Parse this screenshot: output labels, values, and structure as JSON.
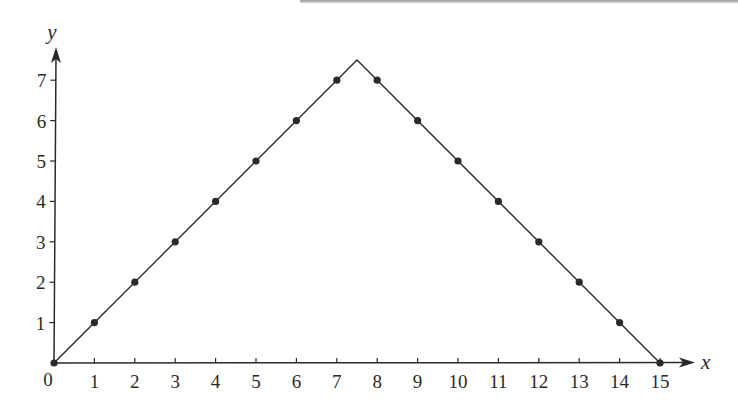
{
  "chart_data": {
    "type": "line",
    "title": "",
    "xlabel": "x",
    "ylabel": "y",
    "xlim": [
      0,
      15
    ],
    "ylim": [
      0,
      7.5
    ],
    "grid": false,
    "legend": null,
    "x_ticks": [
      1,
      2,
      3,
      4,
      5,
      6,
      7,
      8,
      9,
      10,
      11,
      12,
      13,
      14,
      15
    ],
    "y_ticks": [
      1,
      2,
      3,
      4,
      5,
      6,
      7
    ],
    "origin_label": "0",
    "series": [
      {
        "name": "line",
        "style": "solid-line",
        "x": [
          0,
          7.5,
          15
        ],
        "y": [
          0,
          7.5,
          0
        ]
      },
      {
        "name": "points",
        "style": "dots",
        "x": [
          0,
          1,
          2,
          3,
          4,
          5,
          6,
          7,
          8,
          9,
          10,
          11,
          12,
          13,
          14,
          15
        ],
        "y": [
          0,
          1,
          2,
          3,
          4,
          5,
          6,
          7,
          7,
          6,
          5,
          4,
          3,
          2,
          1,
          0
        ]
      }
    ]
  },
  "colors": {
    "ink": "#2a2a2a",
    "background": "#ffffff"
  }
}
